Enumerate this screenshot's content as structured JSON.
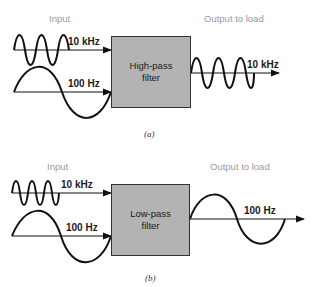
{
  "panel_a": {
    "input_label": "Input",
    "output_label": "Output to load",
    "filter_line1": "High-pass",
    "filter_line2": "filter",
    "input_signals": [
      "10 kHz",
      "100 Hz"
    ],
    "output_signal": "10 kHz",
    "caption": "(a)"
  },
  "panel_b": {
    "input_label": "Input",
    "output_label": "Output to load",
    "filter_line1": "Low-pass",
    "filter_line2": "filter",
    "input_signals": [
      "10 kHz",
      "100 Hz"
    ],
    "output_signal": "100 Hz",
    "caption": "(b)"
  },
  "colors": {
    "filter_fill": "#b3b3b3",
    "line": "#111111",
    "section_label": "#9a9a9a"
  }
}
